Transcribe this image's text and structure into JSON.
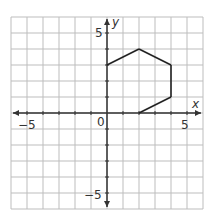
{
  "graph": {
    "axes": {
      "x_label": "x",
      "y_label": "y",
      "origin_label": "0",
      "x_tick_labels": [
        {
          "value": -5,
          "text": "−5"
        },
        {
          "value": 5,
          "text": "5"
        }
      ],
      "y_tick_labels": [
        {
          "value": 5,
          "text": "5"
        },
        {
          "value": -5,
          "text": "−5"
        }
      ]
    },
    "grid": {
      "xmin": -6,
      "xmax": 6,
      "ymin": -6,
      "ymax": 6,
      "step": 1
    },
    "polygon": {
      "vertices": [
        [
          0,
          3
        ],
        [
          2,
          4
        ],
        [
          4,
          3
        ],
        [
          4,
          1
        ],
        [
          2,
          0
        ],
        [
          0,
          0
        ]
      ],
      "drawn_edges": [
        [
          [
            0,
            3
          ],
          [
            2,
            4
          ]
        ],
        [
          [
            2,
            4
          ],
          [
            4,
            3
          ]
        ],
        [
          [
            4,
            3
          ],
          [
            4,
            1
          ]
        ],
        [
          [
            4,
            1
          ],
          [
            2,
            0
          ]
        ]
      ]
    },
    "colors": {
      "grid": "#bdbdbd",
      "axis": "#333333",
      "polygon": "#222222"
    }
  }
}
